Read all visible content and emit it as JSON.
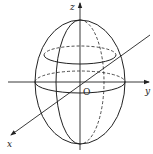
{
  "diagram": {
    "type": "ellipsoid-3d-axes",
    "labels": {
      "z_axis": "z",
      "y_axis": "y",
      "x_axis": "x",
      "origin": "O"
    },
    "colors": {
      "stroke": "#222222",
      "background": "#ffffff"
    }
  }
}
